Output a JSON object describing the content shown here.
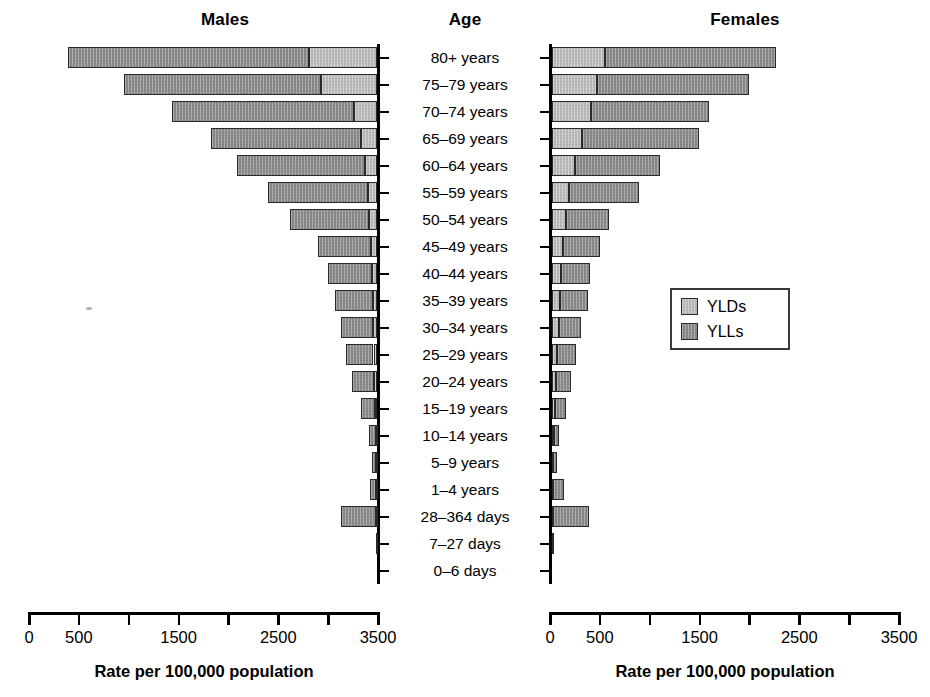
{
  "figure": {
    "males_title": "Males",
    "age_title": "Age",
    "females_title": "Females",
    "males_axis_caption": "Rate per 100,000 population",
    "females_axis_caption": "Rate per 100,000 population"
  },
  "legend": {
    "position": "middle-right",
    "items": [
      {
        "label": "YLDs",
        "color": "#b9b9b9"
      },
      {
        "label": "YLLs",
        "color": "#898989"
      }
    ]
  },
  "axis": {
    "males_tick_labels": [
      "3500",
      "",
      "2500",
      "",
      "1500",
      "",
      "500",
      "0"
    ],
    "females_tick_labels": [
      "0",
      "500",
      "",
      "1500",
      "",
      "2500",
      "",
      "3500"
    ],
    "tick_values": [
      0,
      500,
      1000,
      1500,
      2000,
      2500,
      3000,
      3500
    ],
    "min": 0,
    "max": 3500
  },
  "chart_data": {
    "type": "bar",
    "subtype": "population-pyramid-stacked",
    "title": "",
    "xlabel": "Rate per 100,000 population",
    "ylabel": "Age",
    "xlim": [
      0,
      3500
    ],
    "grid": false,
    "legend_position": "middle-right",
    "panels": [
      "Males",
      "Females"
    ],
    "stack_order_males": [
      "YLLs",
      "YLDs"
    ],
    "stack_order_females": [
      "YLDs",
      "YLLs"
    ],
    "categories": [
      "80+ years",
      "75–79 years",
      "70–74 years",
      "65–69 years",
      "60–64 years",
      "55–59 years",
      "50–54 years",
      "45–49 years",
      "40–44 years",
      "35–39 years",
      "30–34 years",
      "25–29 years",
      "20–24 years",
      "15–19 years",
      "10–14 years",
      "5–9 years",
      "1–4 years",
      "28–364 days",
      "7–27 days",
      "0–6 days"
    ],
    "series": [
      {
        "name": "Males YLLs",
        "panel": "Males",
        "component": "YLLs",
        "color": "#898989",
        "values": [
          2420,
          1980,
          1830,
          1500,
          1280,
          1000,
          790,
          530,
          440,
          380,
          320,
          280,
          225,
          140,
          70,
          45,
          60,
          345,
          8,
          4
        ]
      },
      {
        "name": "Males YLDs",
        "panel": "Males",
        "component": "YLDs",
        "color": "#b9b9b9",
        "values": [
          680,
          560,
          230,
          160,
          120,
          95,
          80,
          60,
          55,
          45,
          40,
          35,
          30,
          22,
          14,
          10,
          10,
          12,
          3,
          2
        ]
      },
      {
        "name": "Females YLDs",
        "panel": "Females",
        "component": "YLDs",
        "color": "#b9b9b9",
        "values": [
          530,
          455,
          390,
          300,
          235,
          175,
          140,
          110,
          95,
          80,
          68,
          55,
          45,
          35,
          20,
          14,
          12,
          14,
          4,
          2
        ]
      },
      {
        "name": "Females YLLs",
        "panel": "Females",
        "component": "YLLs",
        "color": "#898989",
        "values": [
          1720,
          1520,
          1180,
          1170,
          845,
          700,
          430,
          370,
          290,
          280,
          220,
          190,
          145,
          105,
          55,
          35,
          110,
          360,
          10,
          4
        ]
      }
    ]
  }
}
